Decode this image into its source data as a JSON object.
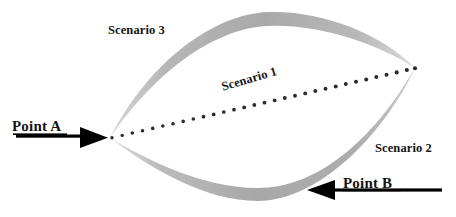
{
  "figure": {
    "type": "conceptual-path-diagram",
    "background_color": "#ffffff",
    "width": 456,
    "height": 217
  },
  "labels": {
    "scenario_1": "Scenario 1",
    "scenario_2": "Scenario 2",
    "scenario_3": "Scenario 3",
    "point_a": "Point A",
    "point_b": "Point B"
  },
  "colors": {
    "crescent_gray": "#ababab",
    "crescent_gray_light": "#c4c4c4",
    "text": "#141414",
    "arrow": "#000000",
    "dot": "#2b2b2b"
  },
  "geometry": {
    "left_vertex": {
      "x": 110,
      "y": 138
    },
    "right_vertex": {
      "x": 415,
      "y": 68
    },
    "upper_arc_apex": {
      "x": 268,
      "y": 12
    },
    "lower_arc_apex": {
      "x": 258,
      "y": 201
    },
    "dotted_line_dot_count": 31,
    "dotted_line_dot_radius": 1.9,
    "scenario_1_rotation_deg": -16.5
  },
  "arrows": {
    "point_a": {
      "direction": "right",
      "shaft_start_x": 16,
      "shaft_end_x": 82,
      "shaft_y": 137,
      "tip_x": 108,
      "head_half_height": 11
    },
    "point_b": {
      "direction": "left",
      "shaft_start_x": 442,
      "shaft_end_x": 335,
      "shaft_y": 190,
      "tip_x": 307,
      "head_half_height": 11
    }
  }
}
